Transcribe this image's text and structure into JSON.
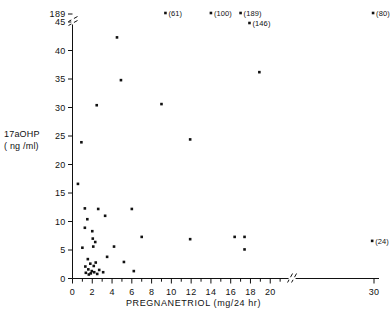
{
  "chart_data": {
    "type": "scatter",
    "title": "",
    "xlabel": "PREGNANETRIOL  (mg/24 hr)",
    "ylabel_line1": "17aOHP",
    "ylabel_line2": "( ng /ml)",
    "xlim": [
      0,
      31
    ],
    "ylim": [
      0,
      48
    ],
    "xticks": [
      "0",
      "2",
      "4",
      "6",
      "8",
      "10",
      "12",
      "14",
      "16",
      "18",
      "20",
      "30"
    ],
    "xtick_values": [
      0,
      2,
      4,
      6,
      8,
      10,
      12,
      14,
      16,
      18,
      20,
      30
    ],
    "xminor_values": [
      1,
      3,
      5,
      7,
      9,
      11,
      13,
      15,
      17,
      19,
      21
    ],
    "yticks": [
      "0",
      "5",
      "10",
      "15",
      "20",
      "25",
      "30",
      "35",
      "40",
      "45",
      "189"
    ],
    "ytick_values": [
      0,
      5,
      10,
      15,
      20,
      25,
      30,
      35,
      40,
      45,
      48
    ],
    "x_axis_break_at": 21.6,
    "y_axis_break_at": 46.4,
    "grid": false,
    "legend": "none",
    "marker": "filled-square",
    "marker_color": "#111111",
    "axis_color": "#111111",
    "points": [
      {
        "x": 0.55,
        "y": 16.6
      },
      {
        "x": 0.9,
        "y": 23.9
      },
      {
        "x": 1.0,
        "y": 5.4
      },
      {
        "x": 1.25,
        "y": 12.3
      },
      {
        "x": 1.25,
        "y": 8.9
      },
      {
        "x": 1.3,
        "y": 2.1
      },
      {
        "x": 1.35,
        "y": 1.0
      },
      {
        "x": 1.5,
        "y": 10.4
      },
      {
        "x": 1.55,
        "y": 3.4
      },
      {
        "x": 1.6,
        "y": 1.6
      },
      {
        "x": 1.65,
        "y": 0.7
      },
      {
        "x": 1.8,
        "y": 2.6
      },
      {
        "x": 1.85,
        "y": 0.9
      },
      {
        "x": 1.95,
        "y": 1.3
      },
      {
        "x": 2.0,
        "y": 8.3
      },
      {
        "x": 2.05,
        "y": 7.0
      },
      {
        "x": 2.1,
        "y": 5.6
      },
      {
        "x": 2.15,
        "y": 2.2
      },
      {
        "x": 2.2,
        "y": 1.1
      },
      {
        "x": 2.3,
        "y": 6.4
      },
      {
        "x": 2.35,
        "y": 2.8
      },
      {
        "x": 2.45,
        "y": 30.4
      },
      {
        "x": 2.5,
        "y": 0.8
      },
      {
        "x": 2.6,
        "y": 12.2
      },
      {
        "x": 2.7,
        "y": 1.5
      },
      {
        "x": 3.1,
        "y": 1.1
      },
      {
        "x": 3.3,
        "y": 11.0
      },
      {
        "x": 3.5,
        "y": 3.8
      },
      {
        "x": 4.2,
        "y": 5.6
      },
      {
        "x": 4.5,
        "y": 42.3
      },
      {
        "x": 4.9,
        "y": 34.8
      },
      {
        "x": 5.2,
        "y": 2.9
      },
      {
        "x": 6.0,
        "y": 12.2
      },
      {
        "x": 6.2,
        "y": 1.3
      },
      {
        "x": 7.0,
        "y": 7.3
      },
      {
        "x": 9.0,
        "y": 30.6
      },
      {
        "x": 11.9,
        "y": 24.4
      },
      {
        "x": 11.9,
        "y": 6.9
      },
      {
        "x": 16.4,
        "y": 7.3
      },
      {
        "x": 17.4,
        "y": 7.3
      },
      {
        "x": 17.4,
        "y": 5.1
      },
      {
        "x": 18.9,
        "y": 36.2
      },
      {
        "x": 29.6,
        "y": 6.6,
        "label": "(24)",
        "label_side": "right"
      }
    ],
    "offscale_points": [
      {
        "x": 9.4,
        "value": 61,
        "label": "(61)"
      },
      {
        "x": 14.0,
        "value": 100,
        "label": "(100)"
      },
      {
        "x": 17.0,
        "value": 189,
        "label": "(189)"
      },
      {
        "x": 17.9,
        "value": 146,
        "label": "(146)"
      },
      {
        "x": 29.8,
        "value": 80,
        "label": "(80)"
      }
    ]
  }
}
